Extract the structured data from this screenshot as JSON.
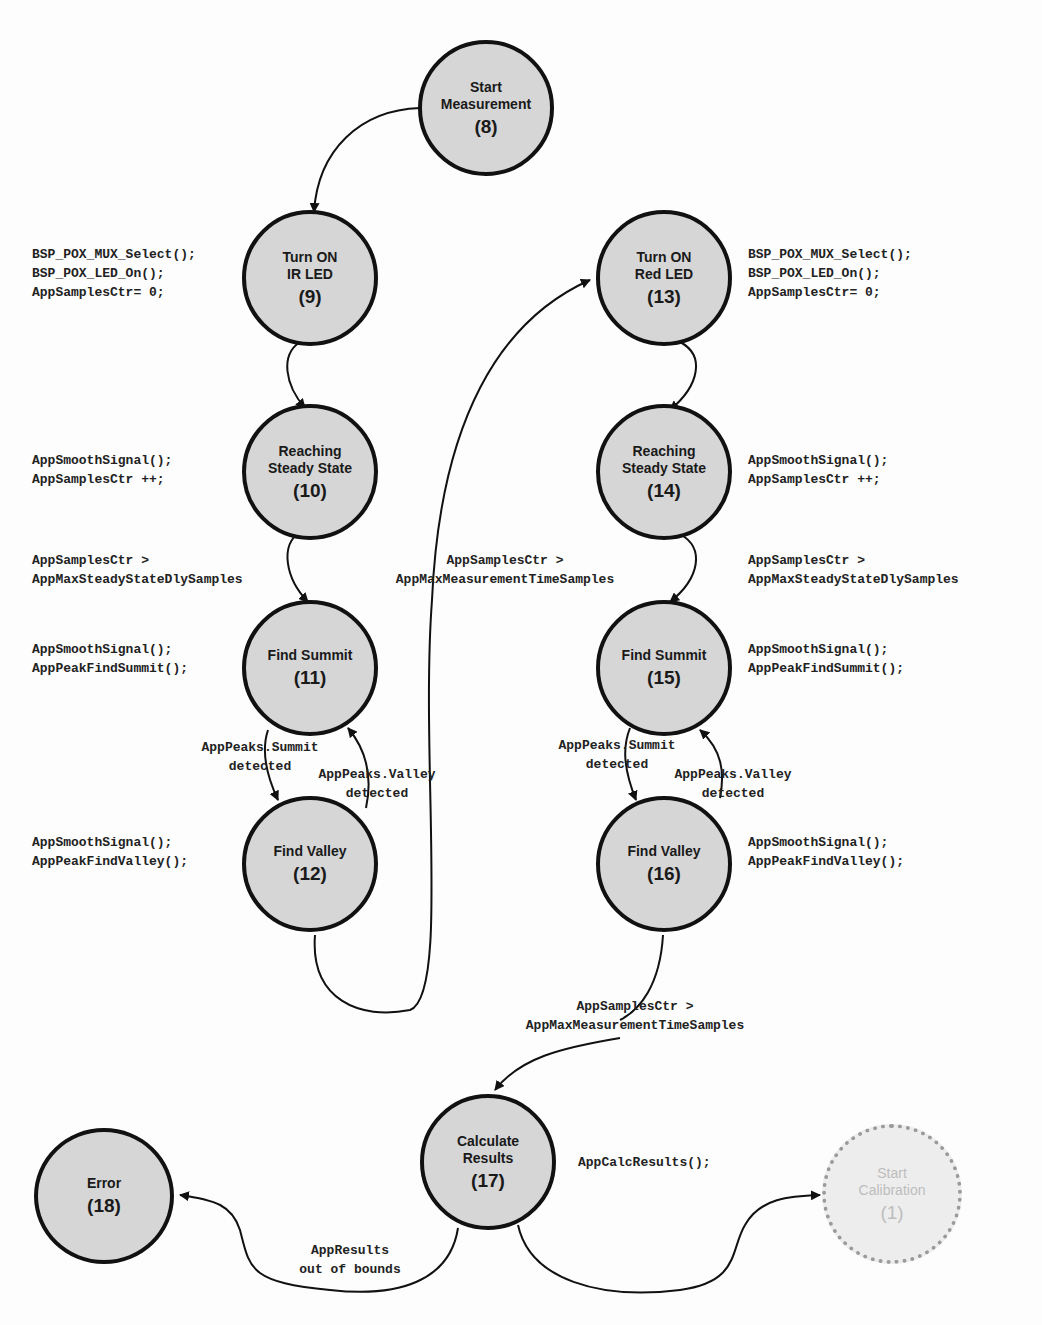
{
  "colors": {
    "state_fill": "#d6d6d6",
    "state_border": "#111111",
    "ghost_fill": "#ededed",
    "ghost_border": "#9a9a9a",
    "ghost_text": "#bdbdbd",
    "edge": "#111111"
  },
  "states": {
    "s8": {
      "name": "Start\nMeasurement",
      "num": "(8)"
    },
    "s9": {
      "name": "Turn ON\nIR LED",
      "num": "(9)"
    },
    "s10": {
      "name": "Reaching\nSteady State",
      "num": "(10)"
    },
    "s11": {
      "name": "Find Summit",
      "num": "(11)"
    },
    "s12": {
      "name": "Find Valley",
      "num": "(12)"
    },
    "s13": {
      "name": "Turn ON\nRed LED",
      "num": "(13)"
    },
    "s14": {
      "name": "Reaching\nSteady State",
      "num": "(14)"
    },
    "s15": {
      "name": "Find Summit",
      "num": "(15)"
    },
    "s16": {
      "name": "Find Valley",
      "num": "(16)"
    },
    "s17": {
      "name": "Calculate\nResults",
      "num": "(17)"
    },
    "s18": {
      "name": "Error",
      "num": "(18)"
    },
    "s1": {
      "name": "Start\nCalibration",
      "num": "(1)"
    }
  },
  "actions": {
    "a9": "BSP_POX_MUX_Select();\nBSP_POX_LED_On();\nAppSamplesCtr= 0;",
    "a10": "AppSmoothSignal();\nAppSamplesCtr ++;",
    "a11": "AppSmoothSignal();\nAppPeakFindSummit();",
    "a12": "AppSmoothSignal();\nAppPeakFindValley();",
    "a13": "BSP_POX_MUX_Select();\nBSP_POX_LED_On();\nAppSamplesCtr= 0;",
    "a14": "AppSmoothSignal();\nAppSamplesCtr ++;",
    "a15": "AppSmoothSignal();\nAppPeakFindSummit();",
    "a16": "AppSmoothSignal();\nAppPeakFindValley();",
    "a17": "AppCalcResults();"
  },
  "transitions": {
    "t10_11": "AppSamplesCtr >\nAppMaxSteadyStateDlySamples",
    "t12_13": "AppSamplesCtr >\nAppMaxMeasurementTimeSamples",
    "t14_15": "AppSamplesCtr >\nAppMaxSteadyStateDlySamples",
    "t11_12": "AppPeaks.Summit\ndetected",
    "t12_11": "AppPeaks.Valley\ndetected",
    "t15_16": "AppPeaks.Summit\ndetected",
    "t16_15": "AppPeaks.Valley\ndetected",
    "t16_17": "AppSamplesCtr >\nAppMaxMeasurementTimeSamples",
    "t17_18": "AppResults\nout of bounds"
  }
}
